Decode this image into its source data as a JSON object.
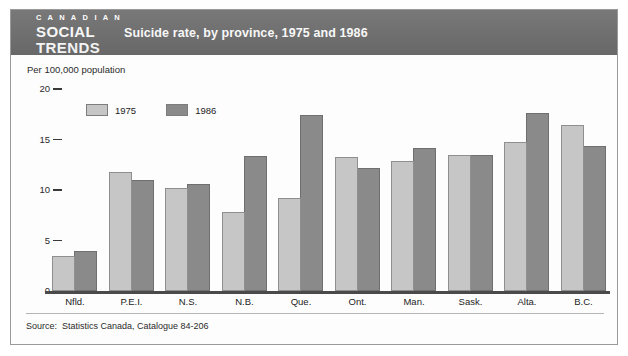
{
  "brand": {
    "line1": "C A N A D I A N",
    "line2": "SOCIAL",
    "line3": "TRENDS"
  },
  "header": {
    "title": "Suicide rate, by province, 1975 and 1986",
    "band_color": "#6e6e6e",
    "text_color": "#ffffff"
  },
  "source": {
    "label": "Source:",
    "text": "Statistics Canada, Catalogue 84-206"
  },
  "colors": {
    "series_1975": "#c6c6c6",
    "series_1986": "#8a8a8a",
    "axis": "#4a4a4a",
    "frame": "#9a9a9a"
  },
  "chart_data": {
    "type": "bar",
    "title": "Suicide rate, by province, 1975 and 1986",
    "subtitle": "",
    "xlabel": "",
    "ylabel": "Per 100,000 population",
    "ylim": [
      0,
      20
    ],
    "yticks": [
      0,
      5,
      10,
      15,
      20
    ],
    "ytick_labels": [
      "0",
      "5",
      "10",
      "15",
      "20"
    ],
    "grid": false,
    "legend_position": "top-left",
    "categories": [
      "Nfld.",
      "P.E.I.",
      "N.S.",
      "N.B.",
      "Que.",
      "Ont.",
      "Man.",
      "Sask.",
      "Alta.",
      "B.C."
    ],
    "series": [
      {
        "name": "1975",
        "color": "#c6c6c6",
        "values": [
          3.5,
          11.8,
          10.2,
          7.8,
          9.2,
          13.3,
          12.9,
          13.5,
          14.8,
          16.4
        ]
      },
      {
        "name": "1986",
        "color": "#8a8a8a",
        "values": [
          4.0,
          11.0,
          10.6,
          13.4,
          17.4,
          12.2,
          14.2,
          13.5,
          17.6,
          14.4
        ]
      }
    ]
  }
}
